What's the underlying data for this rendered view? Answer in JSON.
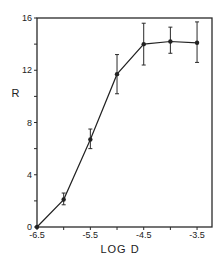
{
  "chart_data": {
    "type": "line",
    "title": "",
    "xlabel": "LOG D",
    "ylabel": "R",
    "xlim": [
      -6.5,
      -3.22
    ],
    "ylim": [
      0,
      16
    ],
    "grid": false,
    "legend": null,
    "x_ticks": [
      -6.5,
      -6.0,
      -5.5,
      -5.0,
      -4.5,
      -4.0,
      -3.5
    ],
    "x_tick_labels": [
      "-6.5",
      "",
      "-5.5",
      "",
      "-4.5",
      "",
      "-3.5"
    ],
    "y_ticks": [
      0,
      2,
      4,
      6,
      8,
      10,
      12,
      14,
      16
    ],
    "y_tick_labels": [
      "0",
      "",
      "4",
      "",
      "8",
      "",
      "12",
      "",
      "16"
    ],
    "series": [
      {
        "name": "R",
        "x": [
          -6.5,
          -6.0,
          -5.5,
          -5.0,
          -4.5,
          -4.0,
          -3.5
        ],
        "y": [
          0,
          2.1,
          6.7,
          11.7,
          14.0,
          14.2,
          14.1
        ],
        "error_low": [
          0,
          1.7,
          6.0,
          10.2,
          12.4,
          13.3,
          12.6
        ],
        "error_high": [
          0,
          2.6,
          7.5,
          13.2,
          15.6,
          15.3,
          15.7
        ],
        "color": "#222222",
        "marker": "circle"
      }
    ]
  }
}
